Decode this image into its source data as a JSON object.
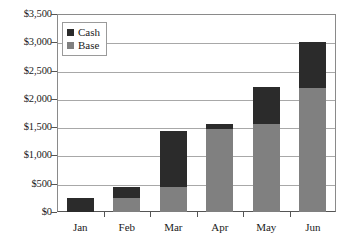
{
  "chart_data": {
    "type": "bar",
    "title": "",
    "subtitle": "",
    "xlabel": "",
    "ylabel": "",
    "stacked": true,
    "grid": true,
    "legend_position": "top-left",
    "categories": [
      "Jan",
      "Feb",
      "Mar",
      "Apr",
      "May",
      "Jun"
    ],
    "series": [
      {
        "name": "Base",
        "color": "#808080",
        "values": [
          0,
          250,
          450,
          1460,
          1550,
          2200
        ]
      },
      {
        "name": "Cash",
        "color": "#2b2b2b",
        "values": [
          250,
          190,
          980,
          90,
          660,
          800
        ]
      }
    ],
    "totals": [
      250,
      440,
      1430,
      1550,
      2210,
      3000
    ],
    "ylim": [
      0,
      3500
    ],
    "ytick_values": [
      3500,
      3000,
      2500,
      2000,
      1500,
      1000,
      500,
      0
    ],
    "ytick_labels": [
      "$3,500",
      "$3,000",
      "$2,500",
      "$2,000",
      "$1,500",
      "$1,000",
      "$500",
      "$0"
    ]
  },
  "legend": {
    "items": [
      {
        "label": "Cash",
        "color": "#2b2b2b"
      },
      {
        "label": "Base",
        "color": "#808080"
      }
    ]
  },
  "axes": {
    "y": {
      "ticks": [
        {
          "label": "$3,500",
          "value": 3500
        },
        {
          "label": "$3,000",
          "value": 3000
        },
        {
          "label": "$2,500",
          "value": 2500
        },
        {
          "label": "$2,000",
          "value": 2000
        },
        {
          "label": "$1,500",
          "value": 1500
        },
        {
          "label": "$1,000",
          "value": 1000
        },
        {
          "label": "$500",
          "value": 500
        },
        {
          "label": "$0",
          "value": 0
        }
      ]
    },
    "x": {
      "ticks": [
        {
          "label": "Jan"
        },
        {
          "label": "Feb"
        },
        {
          "label": "Mar"
        },
        {
          "label": "Apr"
        },
        {
          "label": "May"
        },
        {
          "label": "Jun"
        }
      ]
    }
  },
  "colors": {
    "cash": "#2b2b2b",
    "base": "#808080",
    "grid": "#a8a8a8",
    "axis": "#555555",
    "frame": "#8a8a8a",
    "background": "#ffffff"
  }
}
